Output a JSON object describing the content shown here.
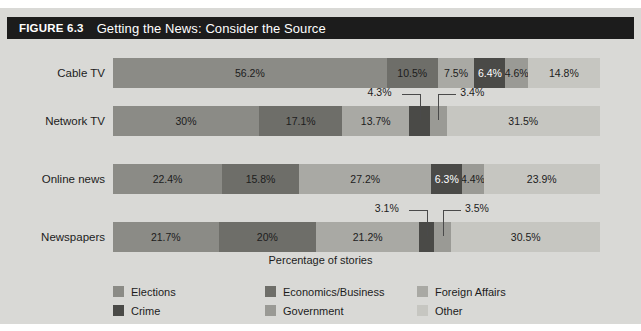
{
  "figure": {
    "number": "FIGURE 6.3",
    "title": "Getting the News: Consider the Source",
    "axis_label": "Percentage of stories",
    "background_color": "#d9d9d6",
    "titlebar_color": "#1c1c1c"
  },
  "legend": {
    "items": [
      {
        "label": "Elections",
        "color": "#8b8b86"
      },
      {
        "label": "Economics/Business",
        "color": "#6e6e69"
      },
      {
        "label": "Foreign Affairs",
        "color": "#a9a9a4"
      },
      {
        "label": "Crime",
        "color": "#4a4a47"
      },
      {
        "label": "Government",
        "color": "#9a9a95"
      },
      {
        "label": "Other",
        "color": "#c6c6c1"
      }
    ]
  },
  "chart_data": {
    "type": "bar",
    "title": "Getting the News: Consider the Source",
    "xlabel": "Percentage of stories",
    "ylabel": "",
    "orientation": "horizontal",
    "stacked": true,
    "xlim": [
      0,
      100
    ],
    "grid": false,
    "legend_position": "bottom",
    "categories": [
      "Cable TV",
      "Network TV",
      "Online news",
      "Newspapers"
    ],
    "series": [
      {
        "name": "Elections",
        "color": "#8b8b86",
        "values": [
          56.2,
          30,
          22.4,
          21.7
        ]
      },
      {
        "name": "Economics/Business",
        "color": "#6e6e69",
        "values": [
          10.5,
          17.1,
          15.8,
          20
        ]
      },
      {
        "name": "Foreign Affairs",
        "color": "#a9a9a4",
        "values": [
          7.5,
          13.7,
          27.2,
          21.2
        ]
      },
      {
        "name": "Crime",
        "color": "#4a4a47",
        "values": [
          6.4,
          4.3,
          6.3,
          3.1
        ]
      },
      {
        "name": "Government",
        "color": "#9a9a95",
        "values": [
          4.6,
          3.4,
          4.4,
          3.5
        ]
      },
      {
        "name": "Other",
        "color": "#c6c6c1",
        "values": [
          14.8,
          31.5,
          23.9,
          30.5
        ]
      }
    ],
    "rows": [
      {
        "category": "Cable TV",
        "segments": [
          {
            "series": "Elections",
            "value": 56.2,
            "label": "56.2%",
            "label_placement": "inside"
          },
          {
            "series": "Economics/Business",
            "value": 10.5,
            "label": "10.5%",
            "label_placement": "inside"
          },
          {
            "series": "Foreign Affairs",
            "value": 7.5,
            "label": "7.5%",
            "label_placement": "inside"
          },
          {
            "series": "Crime",
            "value": 6.4,
            "label": "6.4%",
            "label_placement": "inside"
          },
          {
            "series": "Government",
            "value": 4.6,
            "label": "4.6%",
            "label_placement": "inside"
          },
          {
            "series": "Other",
            "value": 14.8,
            "label": "14.8%",
            "label_placement": "inside"
          }
        ]
      },
      {
        "category": "Network TV",
        "segments": [
          {
            "series": "Elections",
            "value": 30,
            "label": "30%",
            "label_placement": "inside"
          },
          {
            "series": "Economics/Business",
            "value": 17.1,
            "label": "17.1%",
            "label_placement": "inside"
          },
          {
            "series": "Foreign Affairs",
            "value": 13.7,
            "label": "13.7%",
            "label_placement": "inside"
          },
          {
            "series": "Crime",
            "value": 4.3,
            "label": "4.3%",
            "label_placement": "callout"
          },
          {
            "series": "Government",
            "value": 3.4,
            "label": "3.4%",
            "label_placement": "callout"
          },
          {
            "series": "Other",
            "value": 31.5,
            "label": "31.5%",
            "label_placement": "inside"
          }
        ]
      },
      {
        "category": "Online news",
        "segments": [
          {
            "series": "Elections",
            "value": 22.4,
            "label": "22.4%",
            "label_placement": "inside"
          },
          {
            "series": "Economics/Business",
            "value": 15.8,
            "label": "15.8%",
            "label_placement": "inside"
          },
          {
            "series": "Foreign Affairs",
            "value": 27.2,
            "label": "27.2%",
            "label_placement": "inside"
          },
          {
            "series": "Crime",
            "value": 6.3,
            "label": "6.3%",
            "label_placement": "inside"
          },
          {
            "series": "Government",
            "value": 4.4,
            "label": "4.4%",
            "label_placement": "inside"
          },
          {
            "series": "Other",
            "value": 23.9,
            "label": "23.9%",
            "label_placement": "inside"
          }
        ]
      },
      {
        "category": "Newspapers",
        "segments": [
          {
            "series": "Elections",
            "value": 21.7,
            "label": "21.7%",
            "label_placement": "inside"
          },
          {
            "series": "Economics/Business",
            "value": 20,
            "label": "20%",
            "label_placement": "inside"
          },
          {
            "series": "Foreign Affairs",
            "value": 21.2,
            "label": "21.2%",
            "label_placement": "inside"
          },
          {
            "series": "Crime",
            "value": 3.1,
            "label": "3.1%",
            "label_placement": "callout"
          },
          {
            "series": "Government",
            "value": 3.5,
            "label": "3.5%",
            "label_placement": "callout"
          },
          {
            "series": "Other",
            "value": 30.5,
            "label": "30.5%",
            "label_placement": "inside"
          }
        ]
      }
    ]
  }
}
